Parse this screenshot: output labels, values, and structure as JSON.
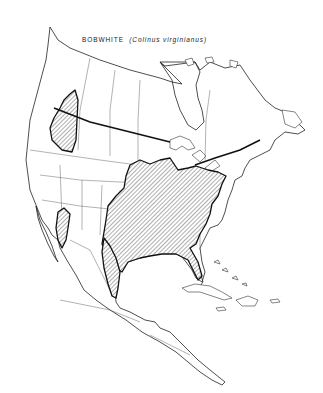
{
  "map": {
    "title_common": "BOBWHITE",
    "title_scientific": "(Colinus virginianus)",
    "region": "North and Central America",
    "style": "black-and-white outline map with hatched range areas",
    "colors": {
      "background": "#ffffff",
      "outline": "#222222",
      "range_hatch": "#333333"
    },
    "range_areas": [
      {
        "name": "Pacific Northwest introduced range",
        "label": ""
      },
      {
        "name": "Main eastern and central US range",
        "label": ""
      },
      {
        "name": "Arizona / Sonora range",
        "label": ""
      },
      {
        "name": "Eastern Mexico Gulf coast range",
        "label": ""
      }
    ]
  }
}
